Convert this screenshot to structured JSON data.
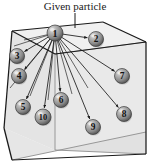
{
  "figure": {
    "caption": "Given particle",
    "caption_position": {
      "x": 75,
      "y": 10
    },
    "leader_line": {
      "x1": 75,
      "y1": 13,
      "x2": 75,
      "y2": 28
    },
    "colors": {
      "background": "#ffffff",
      "box_outline": "#1a1a1a",
      "box_inner_edge": "#8e8e8e",
      "face_top": "#f0f0f0",
      "face_left": "#e4e4e4",
      "face_front": "#e9e9e9",
      "face_right": "#dcdcdc",
      "arrow": "#1a1a1a",
      "sphere_light": "#d8d8d8",
      "sphere_mid": "#9a9a9a",
      "sphere_dark": "#4a4a4a",
      "sphere_text": "#111111",
      "caption_text": "#1a1a1a"
    },
    "box": {
      "description": "3D rectangular box drawn in perspective",
      "outer_outline": "12,31 103,22 146,42 146,154 101,160 12,160 4,128",
      "top_face": "12,31 103,22 146,42 55,54",
      "left_face": "12,31 55,54 55,150 4,128",
      "front_face": "55,54 146,42 146,154 55,150",
      "inner_vertical_edge": {
        "x1": 55,
        "y1": 54,
        "x2": 55,
        "y2": 150
      },
      "inner_top_edge": {
        "x1": 55,
        "y1": 54,
        "x2": 146,
        "y2": 42
      },
      "inner_bottom_edge": {
        "x1": 55,
        "y1": 150,
        "x2": 146,
        "y2": 154
      },
      "back_bottom_edge": {
        "x1": 12,
        "y1": 160,
        "x2": 146,
        "y2": 132
      },
      "left_bottom_edge": {
        "x1": 4,
        "y1": 128,
        "x2": 12,
        "y2": 160
      }
    },
    "source_particle_id": 1,
    "particles": [
      {
        "id": 1,
        "label": "1",
        "x": 55,
        "y": 33,
        "r": 8.0,
        "is_source": true
      },
      {
        "id": 2,
        "label": "2",
        "x": 96,
        "y": 39,
        "r": 7.5,
        "is_source": false
      },
      {
        "id": 3,
        "label": "3",
        "x": 17,
        "y": 56,
        "r": 7.5,
        "is_source": false
      },
      {
        "id": 4,
        "label": "4",
        "x": 19,
        "y": 76,
        "r": 7.5,
        "is_source": false
      },
      {
        "id": 5,
        "label": "5",
        "x": 23,
        "y": 107,
        "r": 7.5,
        "is_source": false
      },
      {
        "id": 6,
        "label": "6",
        "x": 61,
        "y": 100,
        "r": 7.5,
        "is_source": false
      },
      {
        "id": 7,
        "label": "7",
        "x": 122,
        "y": 76,
        "r": 7.5,
        "is_source": false
      },
      {
        "id": 8,
        "label": "8",
        "x": 124,
        "y": 114,
        "r": 7.5,
        "is_source": false
      },
      {
        "id": 9,
        "label": "9",
        "x": 93,
        "y": 127,
        "r": 7.5,
        "is_source": false
      },
      {
        "id": 10,
        "label": "10",
        "x": 43,
        "y": 117,
        "r": 8.0,
        "is_source": false
      }
    ],
    "arrows": [
      {
        "from": 1,
        "to": 2
      },
      {
        "from": 1,
        "to": 3
      },
      {
        "from": 1,
        "to": 4
      },
      {
        "from": 1,
        "to": 5
      },
      {
        "from": 1,
        "to": 6
      },
      {
        "from": 1,
        "to": 7
      },
      {
        "from": 1,
        "to": 8
      },
      {
        "from": 1,
        "to": 9
      },
      {
        "from": 1,
        "to": 10
      }
    ],
    "extra_rays": [
      {
        "x1": 55,
        "y1": 33,
        "x2": 10,
        "y2": 88
      },
      {
        "x1": 55,
        "y1": 33,
        "x2": 30,
        "y2": 96
      },
      {
        "x1": 55,
        "y1": 33,
        "x2": 48,
        "y2": 100
      },
      {
        "x1": 55,
        "y1": 33,
        "x2": 72,
        "y2": 94
      },
      {
        "x1": 55,
        "y1": 33,
        "x2": 88,
        "y2": 88
      },
      {
        "x1": 55,
        "y1": 33,
        "x2": 14,
        "y2": 46
      },
      {
        "x1": 55,
        "y1": 33,
        "x2": 24,
        "y2": 40
      }
    ]
  }
}
